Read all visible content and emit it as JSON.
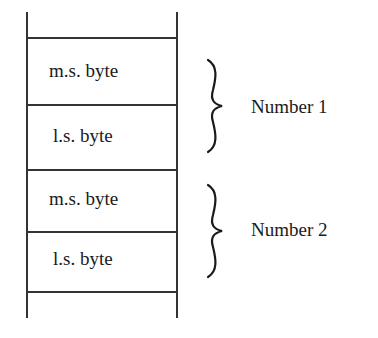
{
  "diagram": {
    "cells": [
      {
        "label": "m.s. byte"
      },
      {
        "label": "l.s. byte"
      },
      {
        "label": "m.s. byte"
      },
      {
        "label": "l.s. byte"
      }
    ],
    "groups": [
      {
        "label": "Number 1"
      },
      {
        "label": "Number 2"
      }
    ]
  }
}
